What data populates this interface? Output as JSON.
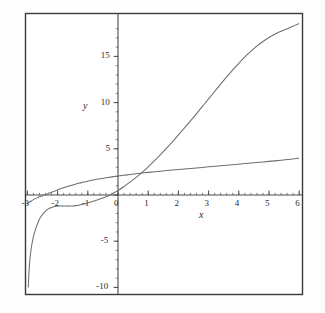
{
  "figure": {
    "background_color": "#fdfdfd",
    "frame_color": "#3a3a3a",
    "axis_color": "#4a4a4a",
    "curve_color": "#6e6e6e",
    "text_color": "#2b2b2b",
    "frame": {
      "left": 25,
      "top": 13,
      "right": 303,
      "bottom": 295
    },
    "origin_px": {
      "x": 118,
      "y": 195
    },
    "px_per_unit": {
      "x": 30.2,
      "y": 9.24
    }
  },
  "chart_data": {
    "type": "line",
    "title": "",
    "xlabel": "x",
    "ylabel": "y",
    "xlim": [
      -3,
      6
    ],
    "ylim": [
      -10,
      18.5
    ],
    "grid": false,
    "legend": "none",
    "xticks": [
      -3,
      -2,
      -1,
      0,
      1,
      2,
      3,
      4,
      5,
      6
    ],
    "xtick_labels": [
      "-3",
      "-2",
      "-1",
      "0",
      "1",
      "2",
      "3",
      "4",
      "5",
      "6"
    ],
    "yticks": [
      -10,
      -5,
      0,
      5,
      10,
      15
    ],
    "ytick_labels": [
      "-10",
      "-5",
      "5",
      "10",
      "15"
    ],
    "minor_tick_step": {
      "x": 0.2,
      "y": 1
    },
    "series": [
      {
        "name": "steep-curve",
        "description": "steep increasing curve with vertical asymptote near x = -3, minimum near x = -2.2, rising to about 18.5 at x = 6",
        "points": [
          [
            -2.97,
            -10.0
          ],
          [
            -2.95,
            -8.4
          ],
          [
            -2.92,
            -7.1
          ],
          [
            -2.89,
            -6.2
          ],
          [
            -2.85,
            -5.3
          ],
          [
            -2.8,
            -4.5
          ],
          [
            -2.75,
            -3.9
          ],
          [
            -2.7,
            -3.4
          ],
          [
            -2.65,
            -3.0
          ],
          [
            -2.6,
            -2.6
          ],
          [
            -2.55,
            -2.35
          ],
          [
            -2.5,
            -2.1
          ],
          [
            -2.4,
            -1.75
          ],
          [
            -2.3,
            -1.5
          ],
          [
            -2.2,
            -1.35
          ],
          [
            -2.1,
            -1.25
          ],
          [
            -2.0,
            -1.2
          ],
          [
            -1.9,
            -1.18
          ],
          [
            -1.8,
            -1.18
          ],
          [
            -1.7,
            -1.2
          ],
          [
            -1.6,
            -1.2
          ],
          [
            -1.5,
            -1.18
          ],
          [
            -1.4,
            -1.15
          ],
          [
            -1.3,
            -1.1
          ],
          [
            -1.2,
            -1.02
          ],
          [
            -1.1,
            -0.95
          ],
          [
            -1.0,
            -0.85
          ],
          [
            -0.9,
            -0.76
          ],
          [
            -0.8,
            -0.66
          ],
          [
            -0.7,
            -0.55
          ],
          [
            -0.6,
            -0.44
          ],
          [
            -0.5,
            -0.32
          ],
          [
            -0.4,
            -0.19
          ],
          [
            -0.3,
            -0.05
          ],
          [
            -0.2,
            0.12
          ],
          [
            -0.1,
            0.3
          ],
          [
            0.0,
            0.5
          ],
          [
            0.2,
            0.92
          ],
          [
            0.4,
            1.4
          ],
          [
            0.6,
            1.9
          ],
          [
            0.8,
            2.45
          ],
          [
            1.0,
            3.05
          ],
          [
            1.2,
            3.7
          ],
          [
            1.4,
            4.35
          ],
          [
            1.6,
            5.05
          ],
          [
            1.8,
            5.75
          ],
          [
            2.0,
            6.5
          ],
          [
            2.25,
            7.45
          ],
          [
            2.5,
            8.4
          ],
          [
            2.75,
            9.4
          ],
          [
            3.0,
            10.4
          ],
          [
            3.25,
            11.4
          ],
          [
            3.5,
            12.4
          ],
          [
            3.75,
            13.35
          ],
          [
            4.0,
            14.25
          ],
          [
            4.25,
            15.1
          ],
          [
            4.5,
            15.85
          ],
          [
            4.75,
            16.5
          ],
          [
            5.0,
            17.05
          ],
          [
            5.25,
            17.5
          ],
          [
            5.5,
            17.85
          ],
          [
            5.75,
            18.2
          ],
          [
            6.0,
            18.55
          ]
        ]
      },
      {
        "name": "shallow-log-curve",
        "description": "shallow concave logarithmic-looking curve rising from about -0.9 at x = -3 to about 4.0 at x = 6, crossing zero near x = -2.1",
        "points": [
          [
            -3.0,
            -0.95
          ],
          [
            -2.9,
            -0.7
          ],
          [
            -2.8,
            -0.5
          ],
          [
            -2.7,
            -0.34
          ],
          [
            -2.6,
            -0.2
          ],
          [
            -2.5,
            -0.07
          ],
          [
            -2.4,
            0.06
          ],
          [
            -2.3,
            0.18
          ],
          [
            -2.2,
            0.3
          ],
          [
            -2.1,
            0.42
          ],
          [
            -2.0,
            0.55
          ],
          [
            -1.8,
            0.78
          ],
          [
            -1.6,
            1.0
          ],
          [
            -1.4,
            1.18
          ],
          [
            -1.2,
            1.34
          ],
          [
            -1.0,
            1.5
          ],
          [
            -0.8,
            1.63
          ],
          [
            -0.6,
            1.75
          ],
          [
            -0.4,
            1.86
          ],
          [
            -0.2,
            1.96
          ],
          [
            0.0,
            2.05
          ],
          [
            0.3,
            2.18
          ],
          [
            0.6,
            2.3
          ],
          [
            1.0,
            2.45
          ],
          [
            1.4,
            2.58
          ],
          [
            1.8,
            2.7
          ],
          [
            2.2,
            2.82
          ],
          [
            2.6,
            2.93
          ],
          [
            3.0,
            3.05
          ],
          [
            3.4,
            3.17
          ],
          [
            3.8,
            3.28
          ],
          [
            4.2,
            3.4
          ],
          [
            4.6,
            3.52
          ],
          [
            5.0,
            3.64
          ],
          [
            5.4,
            3.76
          ],
          [
            5.8,
            3.9
          ],
          [
            6.0,
            3.98
          ]
        ]
      }
    ]
  },
  "labels": {
    "x_axis_name": "x",
    "y_axis_name": "y"
  }
}
